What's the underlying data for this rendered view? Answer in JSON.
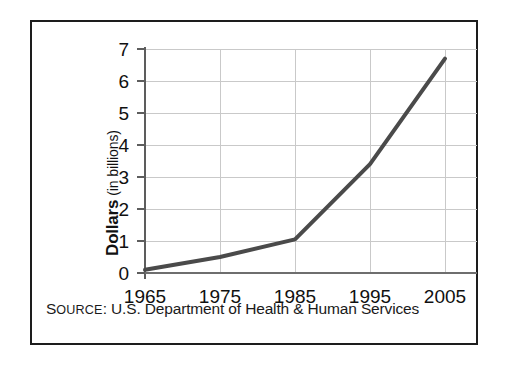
{
  "figure": {
    "source_note": {
      "label_lead": "S",
      "label_rest": "OURCE",
      "label_colon": ":",
      "text": " U.S. Department of Health & Human Services",
      "full": "SOURCE: U.S. Department of Health & Human Services"
    },
    "axis_title_y_strong": "Dollars",
    "axis_title_y_light": "(in billions)"
  },
  "chart_data": {
    "type": "line",
    "title": "",
    "subtitle": "",
    "xlabel": "",
    "ylabel": "Dollars (in billions)",
    "x": [
      1965,
      1975,
      1985,
      1995,
      2005
    ],
    "categories": [
      "1965",
      "1975",
      "1985",
      "1995",
      "2005"
    ],
    "values": [
      0.1,
      0.5,
      1.05,
      3.4,
      6.7
    ],
    "series": [
      {
        "name": "Dollars (in billions)",
        "values": [
          0.1,
          0.5,
          1.05,
          3.4,
          6.7
        ]
      }
    ],
    "xlim": [
      1965,
      2005
    ],
    "ylim": [
      0,
      7
    ],
    "ytick_labels": [
      "0",
      "1",
      "2",
      "3",
      "4",
      "5",
      "6",
      "7"
    ],
    "ytick_values": [
      0,
      1,
      2,
      3,
      4,
      5,
      6,
      7
    ],
    "xtick_labels": [
      "1965",
      "1975",
      "1985",
      "1995",
      "2005"
    ],
    "xtick_values": [
      1965,
      1975,
      1985,
      1995,
      2005
    ],
    "grid": true,
    "legend": false,
    "legend_position": "none",
    "line_color": "#4a4a4a",
    "line_width": 4,
    "grid_color": "#c9c9c9",
    "axis_color": "#606060",
    "annotations": []
  }
}
